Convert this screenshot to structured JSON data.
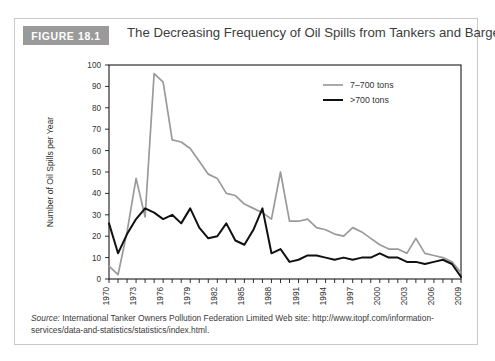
{
  "figure": {
    "badge": "FIGURE 18.1",
    "title": "The Decreasing Frequency of Oil Spills from Tankers and Barges",
    "badge_color": "#9a9a9a"
  },
  "source": {
    "label": "Source:",
    "text": " International Tanker Owners Pollution Federation Limited Web site: http://www.itopf.com/information-services/data-and-statistics/statistics/index.html."
  },
  "chart_data": {
    "type": "line",
    "title": "The Decreasing Frequency of Oil Spills from Tankers and Barges",
    "xlabel": "Year",
    "ylabel": "Number of Oil Spills per Year",
    "xlim": [
      1970,
      2009
    ],
    "ylim": [
      0,
      100
    ],
    "yticks": [
      0,
      10,
      20,
      30,
      40,
      50,
      60,
      70,
      80,
      90,
      100
    ],
    "xticks": [
      1970,
      1973,
      1976,
      1979,
      1982,
      1985,
      1988,
      1991,
      1994,
      1997,
      2000,
      2003,
      2006,
      2009
    ],
    "x": [
      1970,
      1971,
      1972,
      1973,
      1974,
      1975,
      1976,
      1977,
      1978,
      1979,
      1980,
      1981,
      1982,
      1983,
      1984,
      1985,
      1986,
      1987,
      1988,
      1989,
      1990,
      1991,
      1992,
      1993,
      1994,
      1995,
      1996,
      1997,
      1998,
      1999,
      2000,
      2001,
      2002,
      2003,
      2004,
      2005,
      2006,
      2007,
      2008,
      2009
    ],
    "grid": false,
    "legend_position": "top-right",
    "series": [
      {
        "name": "7–700 tons",
        "color": "#9a9a9a",
        "values": [
          6,
          2,
          22,
          47,
          29,
          96,
          92,
          65,
          64,
          61,
          55,
          49,
          47,
          40,
          39,
          35,
          33,
          31,
          28,
          50,
          27,
          27,
          28,
          24,
          23,
          21,
          20,
          24,
          22,
          19,
          16,
          14,
          14,
          12,
          19,
          12,
          11,
          10,
          8,
          3
        ]
      },
      {
        "name": ">700 tons",
        "color": "#111111",
        "values": [
          26,
          12,
          21,
          28,
          33,
          31,
          28,
          30,
          26,
          33,
          24,
          19,
          20,
          26,
          18,
          16,
          23,
          33,
          12,
          14,
          8,
          9,
          11,
          11,
          10,
          9,
          10,
          9,
          10,
          10,
          12,
          10,
          10,
          8,
          8,
          7,
          8,
          9,
          7,
          1
        ]
      }
    ],
    "legend": [
      "7–700 tons",
      ">700 tons"
    ]
  }
}
